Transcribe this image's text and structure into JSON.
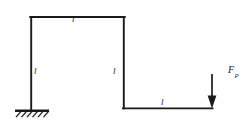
{
  "figure": {
    "type": "structural-mechanics-diagram",
    "background_color": "#ffffff",
    "line_color": "#1a1a1a"
  },
  "labels": {
    "top_member_length": "l",
    "left_member_length": "l",
    "middle_member_length": "l",
    "bottom_member_length": "l",
    "force": "F",
    "force_subscript": "P"
  },
  "geometry": {
    "members": [
      {
        "name": "left-vertical-member",
        "x1": 31,
        "y1": 17,
        "x2": 31,
        "y2": 110,
        "length_label": "l"
      },
      {
        "name": "top-horizontal-member",
        "x1": 31,
        "y1": 17,
        "x2": 124,
        "y2": 17,
        "length_label": "l"
      },
      {
        "name": "middle-vertical-member",
        "x1": 124,
        "y1": 17,
        "x2": 124,
        "y2": 108,
        "length_label": "l"
      },
      {
        "name": "bottom-horizontal-member",
        "x1": 124,
        "y1": 108,
        "x2": 212,
        "y2": 108,
        "length_label": "l"
      }
    ],
    "fixed_support": {
      "name": "fixed-support",
      "x": 31,
      "y": 110,
      "width": 34,
      "hatch_count": 6
    },
    "load_arrow": {
      "name": "point-load-arrow",
      "x": 212,
      "y_start": 74,
      "y_end": 108,
      "direction": "down"
    }
  }
}
